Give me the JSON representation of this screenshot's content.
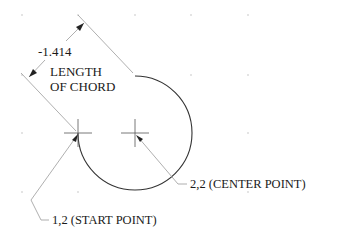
{
  "diagram": {
    "type": "cad-arc-dimension",
    "dimension": {
      "value": "-1.414"
    },
    "chord_label": {
      "line1": "LENGTH",
      "line2": "OF CHORD"
    },
    "center_point": {
      "label": "2,2 (CENTER POINT)",
      "coords": [
        2,
        2
      ]
    },
    "start_point": {
      "label": "1,2 (START POINT)",
      "coords": [
        1,
        2
      ]
    },
    "colors": {
      "arc": "#333333",
      "extension_lines": "#9a9a9a",
      "text": "#1a1a1a",
      "grid_dots": "#b0b0b0"
    }
  }
}
